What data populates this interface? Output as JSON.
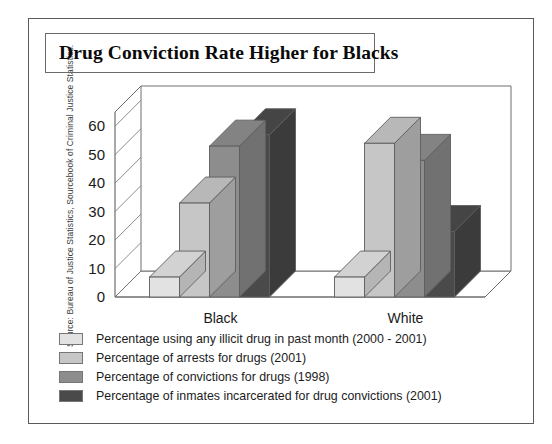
{
  "source_note": "Source: Bureau of Justice Statistics, Sourcebook of Criminal Justice Statistics.",
  "chart_data": {
    "type": "bar",
    "title": "Drug Conviction Rate Higher for Blacks",
    "subtitle": "",
    "xlabel": "",
    "ylabel": "",
    "categories": [
      "Black",
      "White"
    ],
    "series": [
      {
        "name": "Percentage using any illicit drug in past month (2000 - 2001)",
        "color": "#e2e2e2",
        "values": [
          7,
          7
        ]
      },
      {
        "name": "Percentage of arrests for drugs (2001)",
        "color": "#c6c6c6",
        "values": [
          33,
          54
        ]
      },
      {
        "name": "Percentage of convictions for drugs (1998)",
        "color": "#8d8d8d",
        "values": [
          53,
          48
        ]
      },
      {
        "name": "Percentage of inmates incarcerated for drug convictions (2001)",
        "color": "#4a4a4a",
        "values": [
          57,
          23
        ]
      }
    ],
    "ylim": [
      0,
      65
    ],
    "yticks": [
      0,
      10,
      20,
      30,
      40,
      50,
      60
    ],
    "ytick_labels": [
      "0",
      "10",
      "20",
      "30",
      "40",
      "50",
      "60"
    ],
    "grid": true,
    "legend_position": "bottom-left",
    "style": "3d-column",
    "annotations": []
  }
}
